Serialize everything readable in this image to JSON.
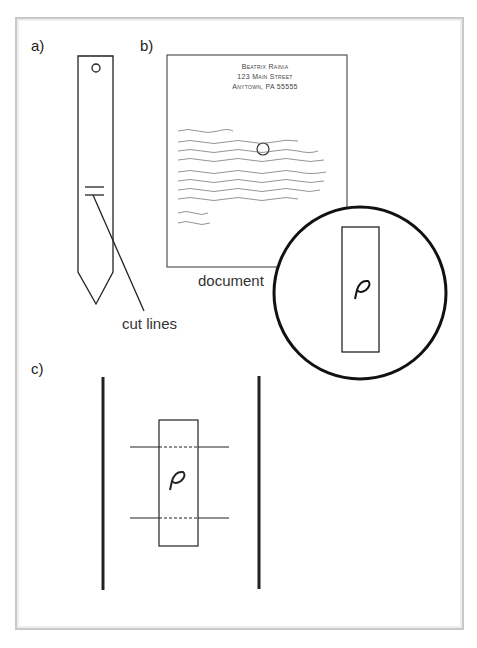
{
  "panels": {
    "a": "a)",
    "b": "b)",
    "c": "c)"
  },
  "document": {
    "sender_name": "Beatrix Rainia",
    "sender_street": "123 Main Street",
    "sender_city": "Anytown, PA 55555",
    "salutation": "Dear Mr. Bertram,",
    "body_lines": [
      "Enclosed you will find a copy of my manuscript",
      "entitled \"The Tanglewood Pages\". It is one of my",
      "best efforts. It explores the nature of time gone by.",
      "As you have requested, I am also enclosing facsimiles",
      "of my artist's illustrations. They should meet with",
      "your art department's approval. I strongly feel to",
      "duplicate a dream with those of you as yet."
    ],
    "closing": "Yours Truly,",
    "signature": "Beatrix Rainia"
  },
  "labels": {
    "document": "document",
    "cut_lines": "cut lines"
  },
  "magnified_glyph": "P",
  "colors": {
    "line": "#222222",
    "frame": "#c8c8c8"
  }
}
